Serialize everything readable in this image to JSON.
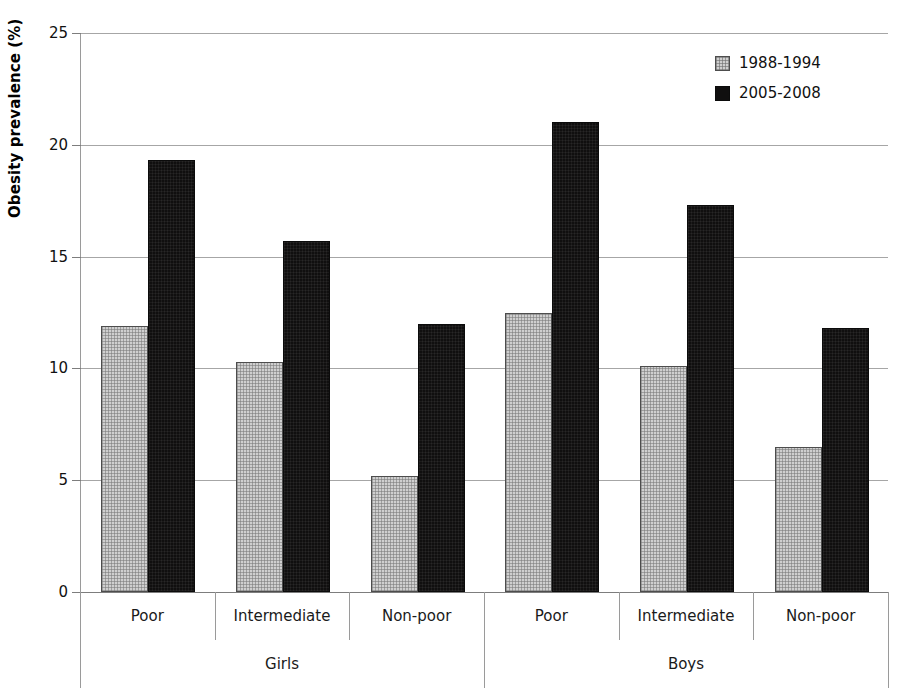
{
  "chart_data": {
    "type": "bar",
    "title": "",
    "subtitle": "",
    "xlabel": "",
    "ylabel": "Obesity prevalence (%)",
    "ylim": [
      0,
      25
    ],
    "yticks": [
      0,
      5,
      10,
      15,
      20,
      25
    ],
    "ytick_labels": [
      "0",
      "5",
      "10",
      "15",
      "20",
      "25"
    ],
    "grid": true,
    "legend_position": "top-right",
    "groups": [
      {
        "label": "Girls",
        "categories": [
          "Poor",
          "Intermediate",
          "Non-poor"
        ]
      },
      {
        "label": "Boys",
        "categories": [
          "Poor",
          "Intermediate",
          "Non-poor"
        ]
      }
    ],
    "categories": [
      "Poor",
      "Intermediate",
      "Non-poor",
      "Poor",
      "Intermediate",
      "Non-poor"
    ],
    "series": [
      {
        "name": "1988-1994",
        "color": "#cfcfcf",
        "pattern": "checkered-gray",
        "values": [
          11.9,
          10.3,
          5.2,
          12.5,
          10.1,
          6.5
        ]
      },
      {
        "name": "2005-2008",
        "color": "#100f0f",
        "pattern": "solid-black",
        "values": [
          19.3,
          15.7,
          12.0,
          21.0,
          17.3,
          11.8
        ]
      }
    ]
  },
  "legend": {
    "entries": [
      {
        "label": "1988-1994"
      },
      {
        "label": "2005-2008"
      }
    ]
  },
  "axes": {
    "y_title": "Obesity prevalence (%)",
    "y_ticks": [
      "0",
      "5",
      "10",
      "15",
      "20",
      "25"
    ],
    "group_labels": [
      "Girls",
      "Boys"
    ],
    "category_labels": [
      "Poor",
      "Intermediate",
      "Non-poor",
      "Poor",
      "Intermediate",
      "Non-poor"
    ]
  }
}
